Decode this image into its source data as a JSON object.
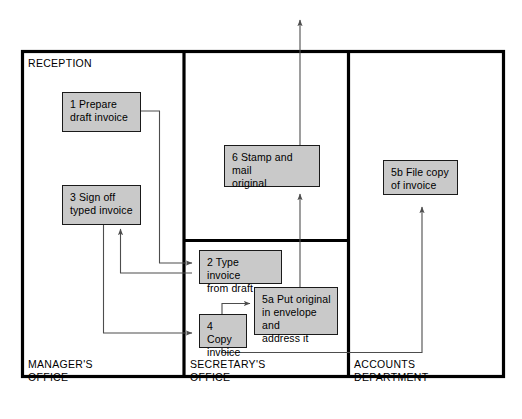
{
  "diagram": {
    "colors": {
      "box_fill": "#c9c9c9",
      "box_border": "#1a1a1a",
      "frame_border": "#000000",
      "connector": "#4d4d4d",
      "background": "#ffffff"
    },
    "zones": [
      {
        "id": "managers-office",
        "label": "MANAGER'S\nOFFICE"
      },
      {
        "id": "reception",
        "label": "RECEPTION"
      },
      {
        "id": "secretarys-office",
        "label": "SECRETARY'S\nOFFICE"
      },
      {
        "id": "accounts-department",
        "label": "ACCOUNTS\nDEPARTMENT"
      }
    ],
    "steps": [
      {
        "id": "step-1",
        "number": "1",
        "label": "1  Prepare\ndraft invoice",
        "zone": "managers-office"
      },
      {
        "id": "step-3",
        "number": "3",
        "label": "3  Sign off\ntyped invoice",
        "zone": "managers-office"
      },
      {
        "id": "step-6",
        "number": "6",
        "label": "6  Stamp and mail\noriginal",
        "zone": "reception"
      },
      {
        "id": "step-2",
        "number": "2",
        "label": "2  Type invoice\nfrom draft",
        "zone": "secretarys-office"
      },
      {
        "id": "step-4",
        "number": "4",
        "label": "4  Copy\ninvoice",
        "zone": "secretarys-office"
      },
      {
        "id": "step-5a",
        "number": "5a",
        "label": "5a  Put original\nin envelope and\naddress it",
        "zone": "secretarys-office"
      },
      {
        "id": "step-5b",
        "number": "5b",
        "label": "5b  File copy\nof invoice",
        "zone": "accounts-department"
      }
    ],
    "connectors": [
      {
        "id": "c1",
        "from": "step-1",
        "to": "step-2"
      },
      {
        "id": "c2",
        "from": "step-2",
        "to": "step-3"
      },
      {
        "id": "c3",
        "from": "step-3",
        "to": "step-4"
      },
      {
        "id": "c4",
        "from": "step-4",
        "to": "step-5a"
      },
      {
        "id": "c5",
        "from": "step-5a",
        "to": "step-6"
      },
      {
        "id": "c6",
        "from": "step-4",
        "to": "step-5b"
      },
      {
        "id": "c7",
        "from": "step-6",
        "to": "out-of-diagram"
      }
    ]
  }
}
